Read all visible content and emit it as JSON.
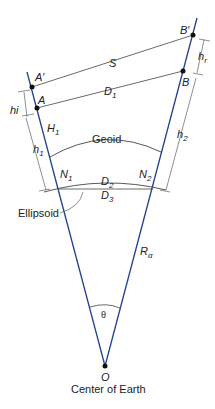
{
  "diagram": {
    "title": "",
    "points": {
      "A_prime": "A′",
      "A": "A",
      "B_prime": "B′",
      "B": "B",
      "O": "O"
    },
    "labels": {
      "S": "S",
      "D1": "D",
      "D1_sub": "1",
      "H1": "H",
      "H1_sub": "1",
      "hi": "hi",
      "hr": "h",
      "hr_sub": "r",
      "h1": "h",
      "h1_sub": "1",
      "h2": "h",
      "h2_sub": "2",
      "geoid": "Geoid",
      "N1": "N",
      "N1_sub": "1",
      "N2": "N",
      "N2_sub": "2",
      "D2": "D",
      "D2_sub": "2",
      "D3": "D",
      "D3_sub": "3",
      "ellipsoid": "Ellipsoid",
      "Ralpha": "R",
      "Ralpha_sub": "α",
      "theta": "θ",
      "center": "Center of Earth"
    },
    "colors": {
      "radial_lines": "#1f3f8f",
      "lines": "#333333",
      "points": "#111111"
    }
  }
}
